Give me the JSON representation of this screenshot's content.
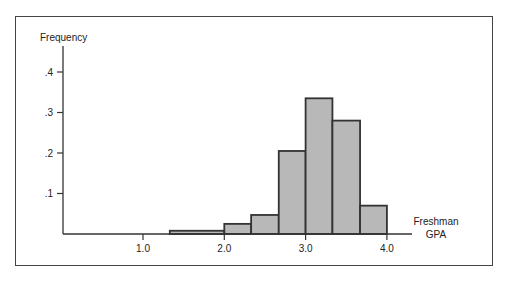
{
  "chart_data": {
    "type": "bar",
    "title": "",
    "xlabel": "Freshman GPA",
    "ylabel": "Frequency",
    "xlabel_lines": [
      "Freshman",
      "GPA"
    ],
    "x_ticks": [
      "1.0",
      "2.0",
      "3.0",
      "4.0"
    ],
    "x_tick_values": [
      1.0,
      2.0,
      3.0,
      4.0
    ],
    "y_ticks": [
      ".1",
      ".2",
      ".3",
      ".4"
    ],
    "y_tick_values": [
      0.1,
      0.2,
      0.3,
      0.4
    ],
    "xlim": [
      0.0,
      4.3
    ],
    "ylim": [
      0,
      0.45
    ],
    "grid": false,
    "bins": [
      {
        "from": 1.33,
        "to": 2.0,
        "value": 0.008
      },
      {
        "from": 2.0,
        "to": 2.33,
        "value": 0.025
      },
      {
        "from": 2.33,
        "to": 2.67,
        "value": 0.047
      },
      {
        "from": 2.67,
        "to": 3.0,
        "value": 0.205
      },
      {
        "from": 3.0,
        "to": 3.33,
        "value": 0.335
      },
      {
        "from": 3.33,
        "to": 3.67,
        "value": 0.28
      },
      {
        "from": 3.67,
        "to": 4.0,
        "value": 0.07
      }
    ],
    "categories": [
      "1.33-2.0",
      "2.0-2.33",
      "2.33-2.67",
      "2.67-3.0",
      "3.0-3.33",
      "3.33-3.67",
      "3.67-4.0"
    ],
    "values": [
      0.008,
      0.025,
      0.047,
      0.205,
      0.335,
      0.28,
      0.07
    ],
    "colors": {
      "bar_fill": "#b8b8b8",
      "bar_edge": "#333333",
      "axis": "#333333",
      "frame": "#444444"
    }
  }
}
